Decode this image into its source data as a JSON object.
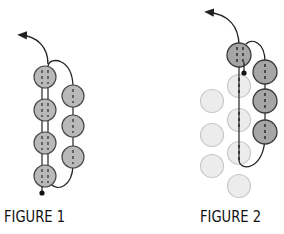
{
  "figures": [
    {
      "caption": "FIGURE 1",
      "description": "Bead stitching path: left column of 4 beads with doubled thread, right column of 3 beads, thread exits with arrow at top-left",
      "colors": {
        "bead_fill": "#b9b9b9",
        "bead_stroke": "#4a4a4a",
        "thread": "#222222"
      }
    },
    {
      "caption": "FIGURE 2",
      "description": "Continuation: highlighted top bead and right column of 3 beads in dark gray, previous beads faded light gray, thread exits with arrow at top-left",
      "colors": {
        "active_fill": "#a6a6a6",
        "active_stroke": "#3a3a3a",
        "faded_fill": "#ececec",
        "faded_stroke": "#c8c8c8",
        "thread": "#222222"
      }
    }
  ]
}
